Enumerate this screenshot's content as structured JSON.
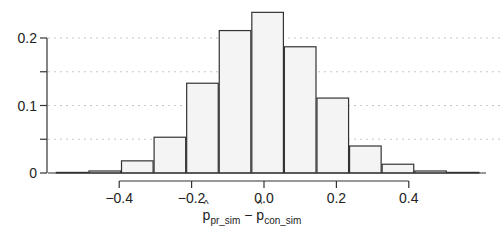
{
  "chart_data": {
    "type": "bar",
    "subtype": "histogram",
    "title": "",
    "xlabel": "p̂_pr_sim − p̂_con_sim",
    "xlabel_parts": {
      "a": "p",
      "a_sub": "pr_sim",
      "minus": " − ",
      "b": "p",
      "b_sub": "con_sim"
    },
    "ylabel": "",
    "bin_width": 0.09,
    "categories": [
      -0.53,
      -0.44,
      -0.35,
      -0.26,
      -0.17,
      -0.08,
      0.01,
      0.1,
      0.19,
      0.28,
      0.37,
      0.46,
      0.55
    ],
    "values": [
      0.0005,
      0.003,
      0.018,
      0.053,
      0.133,
      0.211,
      0.238,
      0.187,
      0.111,
      0.04,
      0.013,
      0.003,
      0.0005
    ],
    "x_ticks": [
      -0.4,
      -0.2,
      0.0,
      0.2,
      0.4
    ],
    "x_tick_labels": [
      "−0.4",
      "−0.2",
      "0.0",
      "0.2",
      "0.4"
    ],
    "y_ticks": [
      0,
      0.05,
      0.1,
      0.15,
      0.2
    ],
    "y_tick_labels": [
      "0",
      "",
      "0.1",
      "",
      "0.2"
    ],
    "xlim": [
      -0.58,
      0.6
    ],
    "ylim": [
      0,
      0.24
    ],
    "grid": "horizontal dotted at y ticks",
    "bar_fill": "#f4f4f4",
    "bar_stroke": "#333333",
    "legend": null
  }
}
